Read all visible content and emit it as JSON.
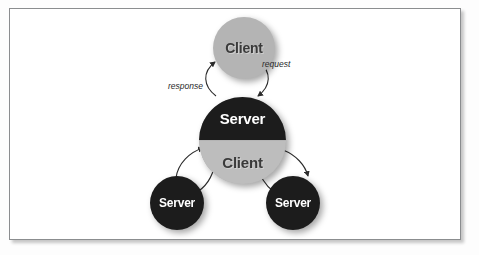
{
  "figure": {
    "kind": "client-server-tiered-architecture-diagram",
    "background_color": "#ffffff",
    "frame_border_color": "#8b8d8f"
  },
  "diagram": {
    "nodes": [
      {
        "id": "client-top",
        "label": "Client",
        "role": "client",
        "fill": "#b4b4b4",
        "text_color": "#3a3a3a",
        "position": "top"
      },
      {
        "id": "middle-tier",
        "label_top": "Server",
        "label_bottom": "Client",
        "role": "server-and-client",
        "fill_top": "#1c1c1c",
        "fill_bottom": "#bdbdbd",
        "text_color_top": "#ffffff",
        "text_color_bottom": "#3a3a3a",
        "position": "center"
      },
      {
        "id": "server-left",
        "label": "Server",
        "role": "server",
        "fill": "#1c1c1c",
        "text_color": "#ffffff",
        "position": "bottom-left"
      },
      {
        "id": "server-right",
        "label": "Server",
        "role": "server",
        "fill": "#1c1c1c",
        "text_color": "#ffffff",
        "position": "bottom-right"
      }
    ],
    "edge_labels": {
      "response": "response",
      "request": "request"
    },
    "edges": [
      {
        "from": "middle-tier",
        "to": "client-top",
        "label": "response",
        "direction": "up"
      },
      {
        "from": "client-top",
        "to": "middle-tier",
        "label": "request",
        "direction": "down"
      },
      {
        "from": "server-left",
        "to": "middle-tier",
        "label": "",
        "direction": "up-right"
      },
      {
        "from": "middle-tier",
        "to": "server-left",
        "label": "",
        "direction": "down-left"
      },
      {
        "from": "middle-tier",
        "to": "server-right",
        "label": "",
        "direction": "down-right"
      },
      {
        "from": "server-right",
        "to": "middle-tier",
        "label": "",
        "direction": "up-left"
      }
    ],
    "arrow_color": "#2b2b2b"
  }
}
